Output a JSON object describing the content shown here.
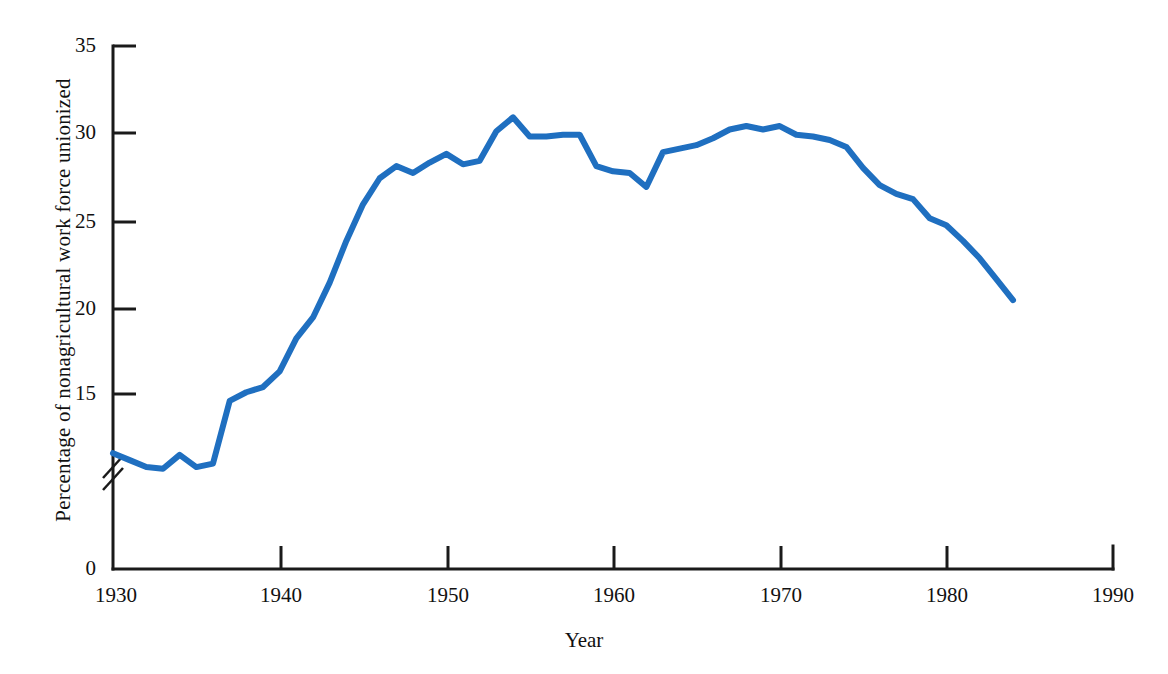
{
  "chart_data": {
    "type": "line",
    "title": "",
    "xlabel": "Year",
    "ylabel": "Percentage of nonagricultural work force unionized",
    "xlim": [
      1930,
      1990
    ],
    "ylim": [
      0,
      35
    ],
    "y_axis_break": true,
    "y_break_note": "axis broken between 0 and about 10",
    "grid": false,
    "legend": "none",
    "xticks": [
      1930,
      1940,
      1950,
      1960,
      1970,
      1980,
      1990
    ],
    "xtick_labels": [
      "1930",
      "1940",
      "1950",
      "1960",
      "1970",
      "1980",
      "1990"
    ],
    "yticks": [
      0,
      15,
      20,
      25,
      30,
      35
    ],
    "ytick_labels": [
      "0",
      "15",
      "20",
      "25",
      "30",
      "35"
    ],
    "series": [
      {
        "name": "Percentage of nonagricultural work force unionized",
        "color": "#1f6fc0",
        "x": [
          1930,
          1931,
          1932,
          1933,
          1934,
          1935,
          1936,
          1937,
          1938,
          1939,
          1940,
          1941,
          1942,
          1943,
          1944,
          1945,
          1946,
          1947,
          1948,
          1949,
          1950,
          1951,
          1952,
          1953,
          1954,
          1955,
          1956,
          1957,
          1958,
          1959,
          1960,
          1961,
          1962,
          1963,
          1964,
          1965,
          1966,
          1967,
          1968,
          1969,
          1970,
          1971,
          1972,
          1973,
          1974,
          1975,
          1976,
          1977,
          1978,
          1979,
          1980,
          1981,
          1982,
          1983,
          1984
        ],
        "y": [
          11.6,
          11.2,
          10.8,
          10.7,
          11.5,
          10.8,
          11.0,
          14.6,
          15.1,
          15.4,
          16.3,
          18.2,
          19.4,
          21.4,
          23.8,
          25.9,
          27.4,
          28.1,
          27.7,
          28.3,
          28.8,
          28.2,
          28.4,
          30.1,
          30.9,
          29.8,
          29.8,
          29.9,
          29.9,
          28.1,
          27.8,
          27.7,
          26.9,
          28.9,
          29.1,
          29.3,
          29.7,
          30.2,
          30.4,
          30.2,
          30.4,
          29.9,
          29.8,
          29.6,
          29.2,
          28.0,
          27.0,
          26.5,
          26.2,
          25.1,
          24.7,
          23.8,
          22.8,
          21.6,
          20.4
        ]
      }
    ],
    "annotations": []
  },
  "axis": {
    "x_title": "Year",
    "y_title": "Percentage of nonagricultural work force unionized"
  }
}
